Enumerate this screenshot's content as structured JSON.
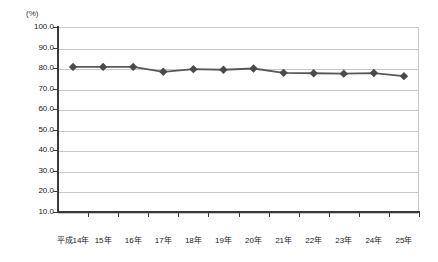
{
  "header": {
    "clipped_title": "",
    "unit_label": "(%)"
  },
  "chart_data": {
    "type": "line",
    "title": "",
    "xlabel": "",
    "ylabel": "(%)",
    "categories": [
      "平成14年",
      "15年",
      "16年",
      "17年",
      "18年",
      "19年",
      "20年",
      "21年",
      "22年",
      "23年",
      "24年",
      "25年"
    ],
    "values": [
      80.6,
      80.6,
      80.6,
      78.2,
      79.5,
      79.2,
      79.8,
      77.7,
      77.5,
      77.3,
      77.6,
      76.1
    ],
    "series": [
      {
        "name": "",
        "values": [
          80.6,
          80.6,
          80.6,
          78.2,
          79.5,
          79.2,
          79.8,
          77.7,
          77.5,
          77.3,
          77.6,
          76.1
        ],
        "line_color": "#595959",
        "marker_color": "#4a4a4a",
        "marker": "diamond"
      }
    ],
    "ylim": [
      10.0,
      100.0
    ],
    "ytick_labels": [
      "100.0",
      "90.0",
      "80.0",
      "70.0",
      "60.0",
      "50.0",
      "40.0",
      "30.0",
      "20.0",
      "10.0"
    ],
    "ytick_values": [
      100.0,
      90.0,
      80.0,
      70.0,
      60.0,
      50.0,
      40.0,
      30.0,
      20.0,
      10.0
    ],
    "grid": true,
    "grid_color": "#c8c8c8",
    "legend": null,
    "legend_position": "none",
    "background": "#ffffff"
  }
}
